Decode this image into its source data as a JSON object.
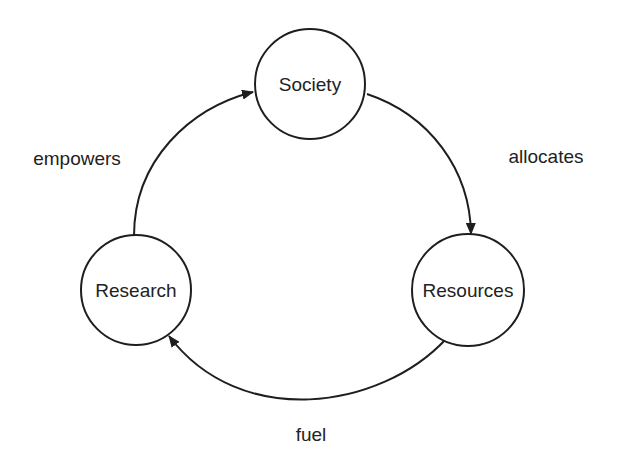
{
  "diagram": {
    "type": "cycle",
    "colors": {
      "stroke": "#1e1e1e",
      "text": "#222222",
      "background": "#ffffff"
    },
    "nodes": [
      {
        "id": "society",
        "label": "Society",
        "cx": 310,
        "cy": 84,
        "r": 55
      },
      {
        "id": "research",
        "label": "Research",
        "cx": 136,
        "cy": 290,
        "r": 55
      },
      {
        "id": "resources",
        "label": "Resources",
        "cx": 468,
        "cy": 290,
        "r": 56
      }
    ],
    "edges": [
      {
        "from": "research",
        "to": "society",
        "label": "empowers"
      },
      {
        "from": "society",
        "to": "resources",
        "label": "allocates"
      },
      {
        "from": "resources",
        "to": "research",
        "label": "fuel"
      }
    ]
  }
}
